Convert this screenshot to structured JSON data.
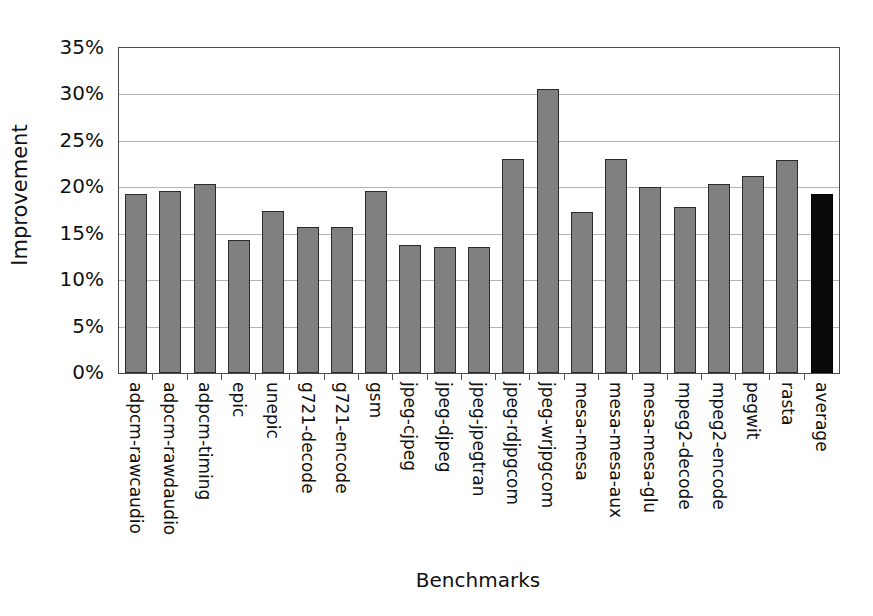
{
  "chart_data": {
    "type": "bar",
    "title": "",
    "xlabel": "Benchmarks",
    "ylabel": "Improvement",
    "ylim": [
      0,
      35
    ],
    "ytick_labels": [
      "35%",
      "30%",
      "25%",
      "20%",
      "15%",
      "10%",
      "5%",
      "0%"
    ],
    "ytick_values": [
      35,
      30,
      25,
      20,
      15,
      10,
      5,
      0
    ],
    "grid": true,
    "legend": "none",
    "unit": "percent",
    "categories": [
      "adpcm-rawcaudio",
      "adpcm-rawdaudio",
      "adpcm-timing",
      "epic",
      "unepic",
      "g721-decode",
      "g721-encode",
      "gsm",
      "jpeg-cjpeg",
      "jpeg-djpeg",
      "jpeg-jpegtran",
      "jpeg-rdjpgcom",
      "jpeg-wrjpgcom",
      "mesa-mesa",
      "mesa-mesa-aux",
      "mesa-mesa-glu",
      "mpeg2-decode",
      "mpeg2-encode",
      "pegwit",
      "rasta",
      "average"
    ],
    "values": [
      19.3,
      19.6,
      20.4,
      14.3,
      17.4,
      15.7,
      15.7,
      19.6,
      13.8,
      13.6,
      13.6,
      23.0,
      30.6,
      17.3,
      23.1,
      20.0,
      17.9,
      20.4,
      21.2,
      22.9,
      19.3
    ],
    "bar_colors": [
      "#808080",
      "#808080",
      "#808080",
      "#808080",
      "#808080",
      "#808080",
      "#808080",
      "#808080",
      "#808080",
      "#808080",
      "#808080",
      "#808080",
      "#808080",
      "#808080",
      "#808080",
      "#808080",
      "#808080",
      "#808080",
      "#808080",
      "#808080",
      "#0a0a0a"
    ],
    "highlight_category": "average",
    "highlight_color": "#0a0a0a",
    "series_color": "#808080",
    "axis_color": "#4a4a4a",
    "grid_color": "#b4b4b4"
  }
}
